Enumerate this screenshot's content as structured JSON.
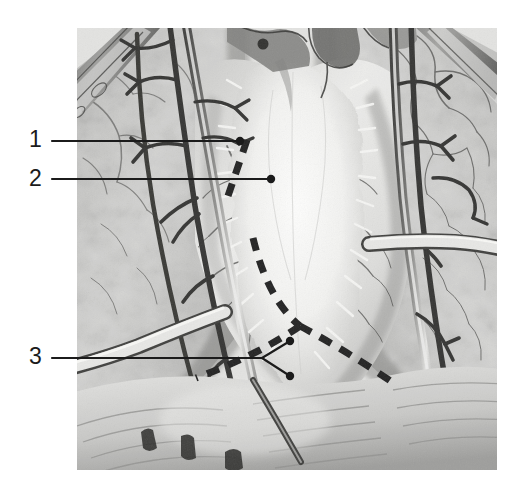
{
  "image": {
    "kind": "anatomical-illustration",
    "title": "Anterior mediastinum exposure with pericardial incision lines",
    "medium": "grayscale pencil drawing",
    "frame": {
      "x": 77,
      "y": 28,
      "width": 420,
      "height": 442
    },
    "background_color": "#ffffff",
    "ink_color": "#1b1b1b"
  },
  "callouts": [
    {
      "id": "callout-1",
      "number": "1",
      "label_x": 29,
      "label_y": 128,
      "line": {
        "x1": 52,
        "y1": 141,
        "x2": 240,
        "y2": 141
      },
      "endpoint": {
        "x": 240,
        "y": 141,
        "style": "dot"
      }
    },
    {
      "id": "callout-2",
      "number": "2",
      "label_x": 29,
      "label_y": 167,
      "line": {
        "x1": 52,
        "y1": 179,
        "x2": 271,
        "y2": 179
      },
      "endpoint": {
        "x": 271,
        "y": 179,
        "style": "dot"
      }
    },
    {
      "id": "callout-3",
      "number": "3",
      "label_x": 29,
      "label_y": 345,
      "line": {
        "x1": 52,
        "y1": 358,
        "x2": 262,
        "y2": 358
      },
      "fork": {
        "origin": {
          "x": 262,
          "y": 358
        },
        "branches": [
          {
            "x": 290,
            "y": 341,
            "style": "dot"
          },
          {
            "x": 290,
            "y": 376,
            "style": "dot"
          }
        ]
      }
    }
  ],
  "incision_markings": {
    "style": "dashed",
    "color": "#1b1b1b",
    "dash_pattern": "13 10",
    "stroke_width": 7,
    "segments": [
      {
        "id": "incision-upper-left",
        "description": "short dashed stub crossing callout lines near thymus",
        "path": "M 247 140 L 228 196"
      },
      {
        "id": "incision-left-limb",
        "description": "left limb of inverted-V pericardial incision",
        "path": "M 253 238 Q 268 300 300 326"
      },
      {
        "id": "incision-lower-left-tail",
        "description": "lower-left tail of incision running toward diaphragm",
        "path": "M 300 326 Q 258 355 196 378"
      },
      {
        "id": "incision-right-limb",
        "description": "right limb of inverted-V pericardial incision",
        "path": "M 300 326 Q 345 350 392 382"
      }
    ]
  },
  "anatomy_regions": [
    {
      "id": "left-lung",
      "label": "lung (patient left, image right)",
      "tone": "mottled light gray"
    },
    {
      "id": "right-lung",
      "label": "lung (patient right, image left)",
      "tone": "mottled light gray"
    },
    {
      "id": "thymus-fat",
      "label": "thymic / mediastinal fat pad",
      "tone": "near white feathered"
    },
    {
      "id": "pericardium",
      "label": "pericardium over heart",
      "tone": "light gray with vessel tracery"
    },
    {
      "id": "diaphragm",
      "label": "diaphragm",
      "tone": "hatched gray"
    },
    {
      "id": "chest-wall",
      "label": "retracted chest wall / sternal edge",
      "tone": "dark gray bevel"
    },
    {
      "id": "vessel-left",
      "label": "internal thoracic vessels, left",
      "tone": "dark linear"
    },
    {
      "id": "vessel-right",
      "label": "internal thoracic vessels, right",
      "tone": "dark linear"
    },
    {
      "id": "great-vessels",
      "label": "great vessels at superior mediastinum",
      "tone": "dark gray"
    }
  ]
}
